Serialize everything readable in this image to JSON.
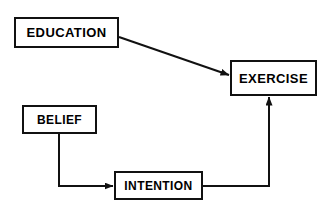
{
  "diagram": {
    "type": "flow-diagram",
    "background_color": "#ffffff",
    "line_color": "#111111",
    "text_color": "#000000",
    "nodes": [
      {
        "id": "education",
        "label": "EDUCATION"
      },
      {
        "id": "exercise",
        "label": "EXERCISE"
      },
      {
        "id": "belief",
        "label": "BELIEF"
      },
      {
        "id": "intention",
        "label": "INTENTION"
      }
    ],
    "edges": [
      {
        "id": "education-to-exercise",
        "from": "EDUCATION",
        "to": "EXERCISE",
        "style": "diagonal-arrow"
      },
      {
        "id": "belief-to-intention",
        "from": "BELIEF",
        "to": "INTENTION",
        "style": "elbow-arrow"
      },
      {
        "id": "intention-to-exercise",
        "from": "INTENTION",
        "to": "EXERCISE",
        "style": "elbow-arrow"
      }
    ]
  }
}
